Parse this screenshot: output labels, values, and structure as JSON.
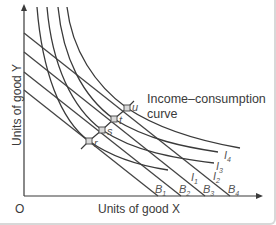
{
  "diagram": {
    "title": "",
    "axes": {
      "x_label": "Units of good X",
      "y_label": "Units of good Y",
      "origin_label": "O"
    },
    "annotation": {
      "line1": "Income–consumption",
      "line2": "curve"
    },
    "budget_lines": [
      {
        "label": "B",
        "sub": "1"
      },
      {
        "label": "B",
        "sub": "2"
      },
      {
        "label": "B",
        "sub": "3"
      },
      {
        "label": "B",
        "sub": "4"
      }
    ],
    "indifference_curves": [
      {
        "label": "I",
        "sub": "1"
      },
      {
        "label": "I",
        "sub": "2"
      },
      {
        "label": "I",
        "sub": "3"
      },
      {
        "label": "I",
        "sub": "4"
      }
    ],
    "points": [
      {
        "label": "r"
      },
      {
        "label": "s"
      },
      {
        "label": "t"
      },
      {
        "label": "u"
      }
    ],
    "colors": {
      "line": "#3a3a3a",
      "budget": "#444444",
      "point_fill": "#d9d9d9",
      "frame": "#d8d8d8"
    }
  }
}
